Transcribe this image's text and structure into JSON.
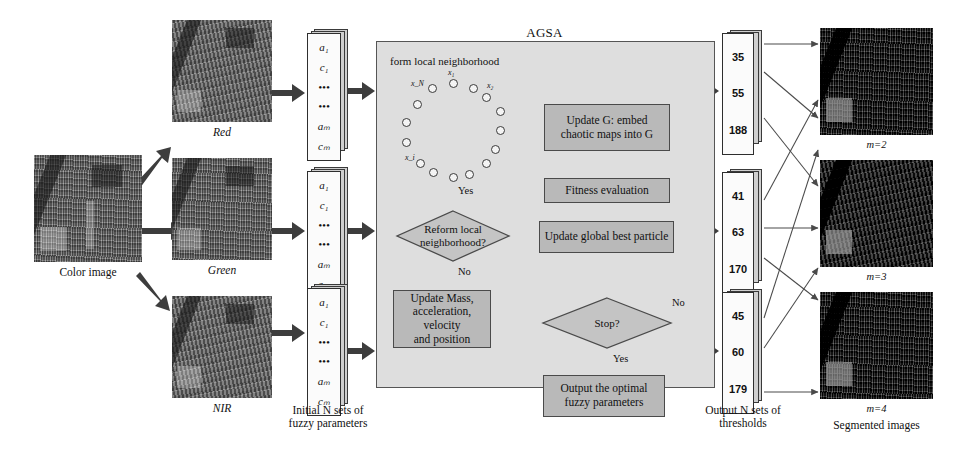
{
  "diagram": {
    "title": "AGSA",
    "source_image_caption": "Color image",
    "channels": [
      {
        "label": "Red"
      },
      {
        "label": "Green"
      },
      {
        "label": "NIR"
      }
    ],
    "vector_caption_line1": "Initial N sets of",
    "vector_caption_line2": "fuzzy parameters",
    "vector_cells": [
      "a₁",
      "c₁",
      "•••",
      "•••",
      "aₘ",
      "cₘ"
    ],
    "neighborhood_label": "form local neighborhood",
    "neighborhood_nodes": [
      "x₁",
      "x₂",
      "x_N",
      "x_i"
    ],
    "process_boxes": [
      {
        "name": "update-g",
        "line1": "Update G: embed",
        "line2": "chaotic maps into G"
      },
      {
        "name": "fitness",
        "line1": "Fitness  evaluation",
        "line2": ""
      },
      {
        "name": "update-global-best",
        "line1": "Update global best particle",
        "line2": ""
      },
      {
        "name": "update-mass",
        "line1": "Update Mass,",
        "line2": "acceleration, velocity",
        "line3": "and position"
      },
      {
        "name": "output-optimal",
        "line1": "Output the optimal",
        "line2": "fuzzy parameters"
      }
    ],
    "decisions": [
      {
        "name": "reform-local",
        "line1": "Reform local",
        "line2": "neighborhood?",
        "yes": "Yes",
        "no": "No"
      },
      {
        "name": "stop",
        "line1": "Stop?",
        "line2": "",
        "yes": "Yes",
        "no": "No"
      }
    ],
    "threshold_caption_line1": "Output N sets of",
    "threshold_caption_line2": "thresholds",
    "threshold_sets": [
      {
        "values": [
          "35",
          "55",
          "188"
        ]
      },
      {
        "values": [
          "41",
          "63",
          "170"
        ]
      },
      {
        "values": [
          "45",
          "60",
          "179"
        ]
      }
    ],
    "segmented_caption": "Segmented images",
    "segmented_images": [
      {
        "label": "m=2"
      },
      {
        "label": "m=3"
      },
      {
        "label": "m=4"
      }
    ]
  }
}
